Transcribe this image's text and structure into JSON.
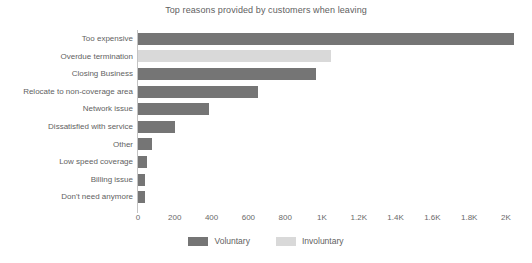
{
  "chart_data": {
    "type": "bar",
    "orientation": "horizontal",
    "title": "Top reasons provided by customers when leaving",
    "xlabel": "",
    "ylabel": "",
    "xlim": [
      0,
      2000
    ],
    "grid": false,
    "legend_position": "bottom-center",
    "categories": [
      "Too expensive",
      "Overdue termination",
      "Closing Business",
      "Relocate to non-coverage area",
      "Network issue",
      "Dissatisfied with service",
      "Other",
      "Low speed coverage",
      "Billing issue",
      "Don't need anymore"
    ],
    "values": [
      2045,
      1050,
      970,
      650,
      385,
      200,
      78,
      50,
      40,
      38
    ],
    "point_types": [
      "Voluntary",
      "Involuntary",
      "Voluntary",
      "Voluntary",
      "Voluntary",
      "Voluntary",
      "Voluntary",
      "Voluntary",
      "Voluntary",
      "Voluntary"
    ],
    "xticks": [
      0,
      200,
      400,
      600,
      800,
      1000,
      1200,
      1400,
      1600,
      1800,
      2000
    ],
    "xtick_labels": [
      "0",
      "200",
      "400",
      "600",
      "800",
      "1K",
      "1.2K",
      "1.4K",
      "1.6K",
      "1.8K",
      "2K"
    ],
    "legend": [
      {
        "label": "Voluntary",
        "color": "#757575"
      },
      {
        "label": "Involuntary",
        "color": "#d9d9d9"
      }
    ],
    "colors": {
      "voluntary": "#757575",
      "involuntary": "#d9d9d9",
      "axis": "#c4c4c4",
      "text": "#5f5f5f",
      "background": "#ffffff"
    }
  }
}
